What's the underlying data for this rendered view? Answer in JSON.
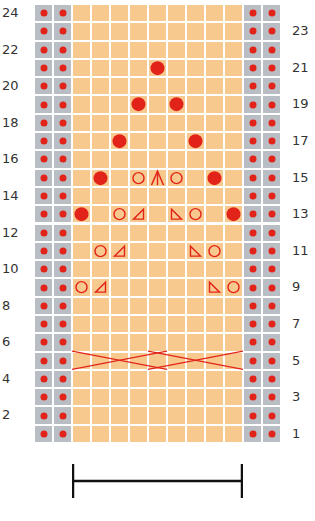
{
  "chart": {
    "rows": 24,
    "columns": 13,
    "edge_columns_left": 2,
    "edge_columns_right": 2,
    "pattern_repeat_columns": 9,
    "colors": {
      "edge_cell": "#b9bec4",
      "main_cell": "#f8c98f",
      "symbol": "#e2231a",
      "grid_line": "#ffffff",
      "label": "#333333"
    },
    "left_row_labels": [
      "2",
      "4",
      "6",
      "8",
      "10",
      "12",
      "14",
      "16",
      "18",
      "20",
      "22",
      "24"
    ],
    "right_row_labels": [
      "1",
      "3",
      "5",
      "7",
      "9",
      "11",
      "13",
      "15",
      "17",
      "19",
      "21",
      "23"
    ],
    "symbols": [
      {
        "row": 21,
        "col": 5,
        "type": "bobble"
      },
      {
        "row": 19,
        "col": 4,
        "type": "bobble"
      },
      {
        "row": 19,
        "col": 6,
        "type": "bobble"
      },
      {
        "row": 17,
        "col": 3,
        "type": "bobble"
      },
      {
        "row": 17,
        "col": 7,
        "type": "bobble"
      },
      {
        "row": 15,
        "col": 2,
        "type": "bobble"
      },
      {
        "row": 15,
        "col": 4,
        "type": "yarn-over"
      },
      {
        "row": 15,
        "col": 5,
        "type": "double-decrease"
      },
      {
        "row": 15,
        "col": 6,
        "type": "yarn-over"
      },
      {
        "row": 15,
        "col": 8,
        "type": "bobble"
      },
      {
        "row": 13,
        "col": 1,
        "type": "bobble"
      },
      {
        "row": 13,
        "col": 3,
        "type": "yarn-over"
      },
      {
        "row": 13,
        "col": 4,
        "type": "k2tog"
      },
      {
        "row": 13,
        "col": 6,
        "type": "ssk"
      },
      {
        "row": 13,
        "col": 7,
        "type": "yarn-over"
      },
      {
        "row": 13,
        "col": 9,
        "type": "bobble"
      },
      {
        "row": 11,
        "col": 2,
        "type": "yarn-over"
      },
      {
        "row": 11,
        "col": 3,
        "type": "k2tog"
      },
      {
        "row": 11,
        "col": 7,
        "type": "ssk"
      },
      {
        "row": 11,
        "col": 8,
        "type": "yarn-over"
      },
      {
        "row": 9,
        "col": 1,
        "type": "yarn-over"
      },
      {
        "row": 9,
        "col": 2,
        "type": "k2tog"
      },
      {
        "row": 9,
        "col": 8,
        "type": "ssk"
      },
      {
        "row": 9,
        "col": 9,
        "type": "yarn-over"
      }
    ],
    "cables": [
      {
        "row": 5,
        "from_col": 1,
        "to_col": 5,
        "type": "cable-cross"
      },
      {
        "row": 5,
        "from_col": 5,
        "to_col": 9,
        "type": "cable-cross"
      }
    ],
    "repeat_bracket": {
      "from_col": 1,
      "to_col": 9,
      "label": "pattern repeat"
    }
  }
}
